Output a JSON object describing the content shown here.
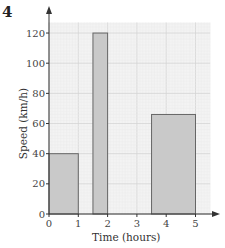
{
  "question_number": "4",
  "chart_data": {
    "type": "bar",
    "title": "",
    "xlabel": "Time (hours)",
    "ylabel": "Speed (km/h)",
    "xlim": [
      0,
      5.5
    ],
    "ylim": [
      0,
      127
    ],
    "x_ticks": [
      0,
      1,
      2,
      3,
      4,
      5
    ],
    "y_ticks": [
      0,
      20,
      40,
      60,
      80,
      100,
      120
    ],
    "grid": true,
    "bars": [
      {
        "x_start": 0,
        "x_end": 1,
        "value": 40
      },
      {
        "x_start": 1.5,
        "x_end": 2,
        "value": 120
      },
      {
        "x_start": 3.5,
        "x_end": 5,
        "value": 66
      }
    ]
  },
  "colors": {
    "bar_fill": "#c9c9c9",
    "bar_stroke": "#666666",
    "grid_minor": "#ececec",
    "grid_major": "#d4d4d4",
    "plot_bg": "#f3f3f3",
    "axis": "#333333"
  }
}
